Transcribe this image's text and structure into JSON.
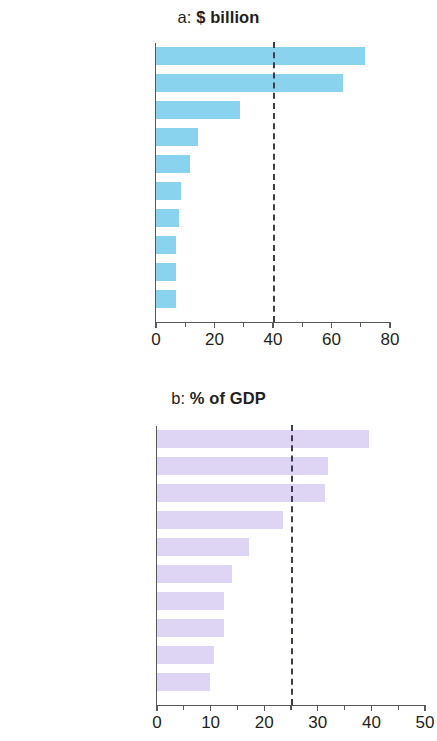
{
  "chart_data": [
    {
      "type": "bar",
      "orientation": "horizontal",
      "panel_id": "a",
      "title": "a: $ billion",
      "title_prefix": "a:",
      "title_main": "$ billion",
      "xlabel": "",
      "ylabel": "",
      "xlim": [
        0,
        80
      ],
      "xticks": [
        0,
        20,
        40,
        60,
        80
      ],
      "xtick_labels": [
        "0",
        "20",
        "40",
        "60",
        "80"
      ],
      "minor_xticks": [
        10,
        30,
        50,
        70
      ],
      "grid": false,
      "legend": "none",
      "bar_color": "#8ad3ef",
      "reference_line": {
        "value": 40,
        "style": "dashed",
        "color": "#3d3d4e"
      },
      "categories": [
        "India",
        "PRC",
        "Philippines",
        "Bangladesh",
        "Viet Nam",
        "Indonesia",
        "Sri Lanka",
        "Uzbekistan",
        "Korea, Rep. of",
        "Nepal"
      ],
      "values": [
        71.5,
        64.0,
        28.8,
        14.5,
        11.6,
        8.7,
        8.0,
        6.8,
        6.8,
        6.8
      ]
    },
    {
      "type": "bar",
      "orientation": "horizontal",
      "panel_id": "b",
      "title": "b: % of GDP",
      "title_prefix": "b:",
      "title_main": "% of GDP",
      "xlabel": "",
      "ylabel": "",
      "xlim": [
        0,
        50
      ],
      "xticks": [
        0,
        10,
        20,
        30,
        40,
        50
      ],
      "xtick_labels": [
        "0",
        "10",
        "20",
        "30",
        "40",
        "50"
      ],
      "minor_xticks": [
        5,
        15,
        25,
        35,
        45
      ],
      "grid": false,
      "legend": "none",
      "bar_color": "#ddd5f3",
      "reference_line": {
        "value": 25,
        "style": "dashed",
        "color": "#3d3d4e"
      },
      "categories": [
        "Tajikistan",
        "Nepal",
        "Kyrgyz Republic",
        "Armenia",
        "Samoa",
        "Georgia",
        "Tonga",
        "Marshall Islands",
        "Uzbekistan",
        "Sri Lanka"
      ],
      "values": [
        39.6,
        31.9,
        31.3,
        23.5,
        17.2,
        14.0,
        12.5,
        12.5,
        10.6,
        9.8
      ]
    }
  ]
}
